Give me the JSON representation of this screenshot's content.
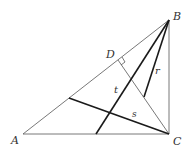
{
  "diagram": {
    "type": "geometry",
    "points": {
      "A": {
        "label": "A",
        "x": 23,
        "y": 134
      },
      "B": {
        "label": "B",
        "x": 169,
        "y": 20
      },
      "C": {
        "label": "C",
        "x": 169,
        "y": 134
      },
      "D": {
        "label": "D",
        "x": 118,
        "y": 60
      }
    },
    "segments": {
      "t": {
        "label": "t"
      },
      "r": {
        "label": "r"
      },
      "s": {
        "label": "s"
      }
    },
    "right_angle_at": "D"
  }
}
